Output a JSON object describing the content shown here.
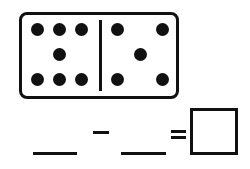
{
  "domino": {
    "left_pips": 7,
    "right_pips": 5
  },
  "equation": {
    "operator": "-",
    "equals": "=",
    "blank_1": "",
    "blank_2": "",
    "answer": ""
  },
  "colors": {
    "ink": "#111111",
    "background": "#ffffff"
  }
}
